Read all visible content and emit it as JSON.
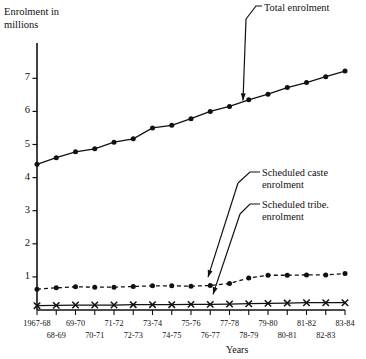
{
  "chart_data": {
    "type": "line",
    "title": "",
    "ylabel": "Enrolment in millions",
    "xlabel": "Years",
    "ylim": [
      0,
      7.4
    ],
    "yticks": [
      1,
      2,
      3,
      4,
      5,
      6,
      7
    ],
    "grid": false,
    "legend_position": "annotations",
    "categories": [
      "1967-68",
      "68-69",
      "69-70",
      "70-71",
      "71-72",
      "72-73",
      "73-74",
      "74-75",
      "75-76",
      "76-77",
      "77-78",
      "78-79",
      "79-80",
      "80-81",
      "81-82",
      "82-83",
      "83-84"
    ],
    "series": [
      {
        "name": "Total enrolment",
        "marker": "filled-circle",
        "linestyle": "solid",
        "values": [
          4.4,
          4.6,
          4.78,
          4.87,
          5.07,
          5.17,
          5.5,
          5.58,
          5.78,
          6.0,
          6.15,
          6.35,
          6.52,
          6.72,
          6.87,
          7.05,
          7.22
        ]
      },
      {
        "name": "Scheduled caste enrolment",
        "marker": "filled-circle",
        "linestyle": "dashed",
        "values": [
          0.63,
          0.67,
          0.7,
          0.69,
          0.69,
          0.71,
          0.73,
          0.73,
          0.72,
          0.74,
          0.8,
          0.97,
          1.05,
          1.05,
          1.06,
          1.06,
          1.1
        ]
      },
      {
        "name": "Scheduled tribe. enrolment",
        "marker": "cross",
        "linestyle": "solid",
        "values": [
          0.13,
          0.14,
          0.15,
          0.15,
          0.15,
          0.16,
          0.16,
          0.16,
          0.17,
          0.17,
          0.18,
          0.19,
          0.2,
          0.21,
          0.22,
          0.22,
          0.22
        ]
      }
    ],
    "annotations": [
      {
        "text_line1": "Total enrolment",
        "text_line2": "",
        "target": "1977-78"
      },
      {
        "text_line1": "Scheduled caste",
        "text_line2": "enrolment",
        "target": "1975-76"
      },
      {
        "text_line1": "Scheduled tribe.",
        "text_line2": "enrolment",
        "target": "1976-77"
      }
    ]
  },
  "axes": {
    "y_axis_title_line1": "Enrolment in",
    "y_axis_title_line2": "millions",
    "x_axis_title": "Years",
    "y_tick_labels": [
      "7",
      "6",
      "5",
      "4",
      "3",
      "2",
      "1"
    ],
    "x_tick_labels_upper": [
      "1967-68",
      "69-70",
      "71-72",
      "73-74",
      "75-76",
      "77-78",
      "79-80",
      "81-82",
      "83-84"
    ],
    "x_tick_labels_lower": [
      "68-69",
      "70-71",
      "72-73",
      "74-75",
      "76-77",
      "78-79",
      "80-81",
      "82-83"
    ]
  },
  "annotations": {
    "total": "Total enrolment",
    "caste_line1": "Scheduled caste",
    "caste_line2": "enrolment",
    "tribe_line1": "Scheduled tribe.",
    "tribe_line2": "enrolment"
  },
  "colors": {
    "ink": "#111111",
    "background": "#ffffff"
  }
}
